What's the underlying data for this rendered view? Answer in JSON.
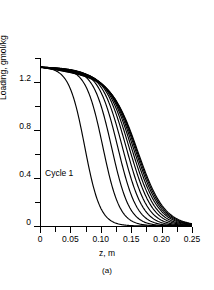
{
  "chart_data": {
    "type": "line",
    "title": "",
    "subtitle": "",
    "xlabel": "z, m",
    "ylabel": "Loading, gmol/kg",
    "caption": "(a)",
    "xlim": [
      0,
      0.25
    ],
    "ylim": [
      0,
      1.4
    ],
    "xticks": [
      0,
      0.05,
      0.1,
      0.15,
      0.2,
      0.25
    ],
    "xticklabels": [
      "0",
      "0.05",
      "0.10",
      "0.15",
      "0.20",
      "0.25"
    ],
    "xminorticks": [
      0.025,
      0.075,
      0.125,
      0.175,
      0.225
    ],
    "yticks": [
      0,
      0.4,
      0.8,
      1.2
    ],
    "yticklabels": [
      "0",
      "0.4",
      "0.8",
      "1.2"
    ],
    "yminorticks": [
      0.2,
      0.6,
      1.0,
      1.4
    ],
    "grid": false,
    "legend": false,
    "annotations": [
      {
        "text": "Cycle 1",
        "x": 0.038,
        "y": 0.5
      }
    ],
    "plateau_loading": 1.32,
    "series_count": 12,
    "series": [
      {
        "name": "Cycle 1",
        "midpoint": 0.0735,
        "steepness": 78,
        "plateau": 1.325
      },
      {
        "name": "Cycle 2",
        "midpoint": 0.1035,
        "steepness": 72,
        "plateau": 1.325
      },
      {
        "name": "Cycle 3",
        "midpoint": 0.118,
        "steepness": 68,
        "plateau": 1.325
      },
      {
        "name": "Cycle 4",
        "midpoint": 0.1285,
        "steepness": 64,
        "plateau": 1.325
      },
      {
        "name": "Cycle 5",
        "midpoint": 0.1365,
        "steepness": 60,
        "plateau": 1.325
      },
      {
        "name": "Cycle 6",
        "midpoint": 0.143,
        "steepness": 57,
        "plateau": 1.325
      },
      {
        "name": "Cycle 7",
        "midpoint": 0.1482,
        "steepness": 54,
        "plateau": 1.325
      },
      {
        "name": "Cycle 8",
        "midpoint": 0.1524,
        "steepness": 52,
        "plateau": 1.325
      },
      {
        "name": "Cycle 9",
        "midpoint": 0.1558,
        "steepness": 50,
        "plateau": 1.325
      },
      {
        "name": "Cycle 10",
        "midpoint": 0.1586,
        "steepness": 49,
        "plateau": 1.325
      },
      {
        "name": "Cycle 11",
        "midpoint": 0.1608,
        "steepness": 48,
        "plateau": 1.325
      },
      {
        "name": "Cycle 12",
        "midpoint": 0.1626,
        "steepness": 47,
        "plateau": 1.325
      }
    ],
    "colors": {
      "line": "#000000",
      "axis": "#000000",
      "background": "#ffffff"
    }
  }
}
